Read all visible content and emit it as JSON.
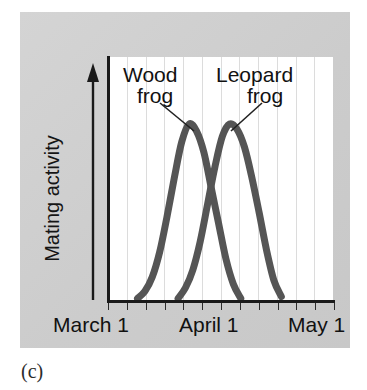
{
  "figure": {
    "caption": "(c)",
    "background_color": "#cfcfcf",
    "plot_background_color": "#ffffff",
    "curve_color": "#555555",
    "axis_color": "#1a1a1a",
    "gridline_color": "#dcdcdc"
  },
  "chart_data": {
    "type": "line",
    "title": "",
    "subtitle": "",
    "xlabel": "",
    "ylabel": "Mating activity",
    "grid": true,
    "grid_axis": "x",
    "legend_position": "inline-annotations",
    "xtick_labels": [
      "March 1",
      "April 1",
      "May 1"
    ],
    "xtick_positions": [
      0,
      31,
      61
    ],
    "xlim": [
      0,
      61
    ],
    "ylim": [
      0,
      1
    ],
    "ytick_labels": [],
    "x_unit": "days since March 1",
    "annotations": [
      {
        "text": "Wood frog",
        "line1": "Wood",
        "line2": "frog",
        "points_to_series": "Wood frog"
      },
      {
        "text": "Leopard frog",
        "line1": "Leopard",
        "line2": "frog",
        "points_to_series": "Leopard frog"
      }
    ],
    "series": [
      {
        "name": "Wood frog",
        "color": "#555555",
        "peak_x_label": "March 23",
        "peak_x": 22,
        "peak_y": 1.0,
        "x": [
          8,
          10,
          12,
          14,
          16,
          18,
          20,
          22,
          24,
          26,
          28,
          30,
          32,
          34,
          36
        ],
        "values": [
          0.02,
          0.06,
          0.14,
          0.28,
          0.48,
          0.7,
          0.9,
          1.0,
          0.96,
          0.84,
          0.64,
          0.44,
          0.24,
          0.1,
          0.02
        ]
      },
      {
        "name": "Leopard frog",
        "color": "#555555",
        "peak_x_label": "April 3",
        "peak_x": 33,
        "peak_y": 1.0,
        "x": [
          19,
          21,
          23,
          25,
          27,
          29,
          31,
          33,
          35,
          37,
          39,
          41,
          43,
          45,
          47
        ],
        "values": [
          0.02,
          0.08,
          0.18,
          0.34,
          0.55,
          0.76,
          0.93,
          1.0,
          0.97,
          0.87,
          0.7,
          0.5,
          0.29,
          0.12,
          0.03
        ]
      }
    ]
  }
}
